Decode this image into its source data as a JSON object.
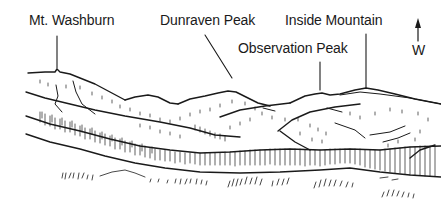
{
  "diagram": {
    "type": "labeled-landscape-sketch",
    "ink_color": "#1a1a1a",
    "background": "#ffffff",
    "labels": [
      {
        "id": "mt-washburn",
        "text": "Mt. Washburn"
      },
      {
        "id": "dunraven-peak",
        "text": "Dunraven Peak"
      },
      {
        "id": "inside-mountain",
        "text": "Inside Mountain"
      },
      {
        "id": "observation-peak",
        "text": "Observation Peak"
      }
    ],
    "compass": {
      "arrow": "up",
      "direction_label": "W"
    }
  }
}
